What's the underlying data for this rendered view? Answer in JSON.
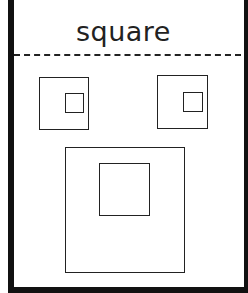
{
  "worksheet": {
    "title": "square",
    "colors": {
      "border": "#111111",
      "stroke": "#222222",
      "background": "#ffffff"
    },
    "shapes": [
      {
        "name": "small-square-left",
        "outer": {
          "x": 39,
          "y": 77,
          "w": 50,
          "h": 53
        },
        "inner": {
          "x": 65,
          "y": 93,
          "w": 19,
          "h": 20
        }
      },
      {
        "name": "small-square-right",
        "outer": {
          "x": 157,
          "y": 75,
          "w": 51,
          "h": 54
        },
        "inner": {
          "x": 183,
          "y": 92,
          "w": 20,
          "h": 20
        }
      },
      {
        "name": "large-square-bottom",
        "outer": {
          "x": 65,
          "y": 147,
          "w": 120,
          "h": 126
        },
        "inner": {
          "x": 99,
          "y": 163,
          "w": 51,
          "h": 53
        }
      }
    ]
  }
}
